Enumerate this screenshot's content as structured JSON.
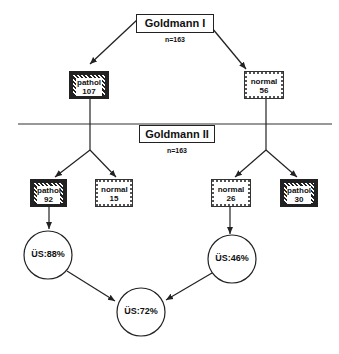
{
  "diagram": {
    "stage1": {
      "title": "Goldmann I",
      "n": "n=163",
      "branches": [
        {
          "type": "pathol",
          "label": "pathol",
          "value": "107"
        },
        {
          "type": "normal",
          "label": "normal",
          "value": "56"
        }
      ]
    },
    "stage2": {
      "title": "Goldmann II",
      "n": "n=163",
      "from_pathol": [
        {
          "type": "pathol",
          "label": "pathol",
          "value": "92"
        },
        {
          "type": "normal",
          "label": "normal",
          "value": "15"
        }
      ],
      "from_normal": [
        {
          "type": "normal",
          "label": "normal",
          "value": "26"
        },
        {
          "type": "pathol",
          "label": "pathol",
          "value": "30"
        }
      ]
    },
    "outcomes": {
      "left": "ÜS:88%",
      "right": "ÜS:46%",
      "combined": "ÜS:72%"
    },
    "colors": {
      "line": "#222222",
      "background": "#ffffff"
    }
  }
}
